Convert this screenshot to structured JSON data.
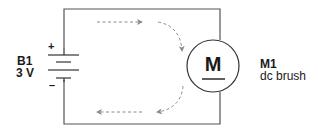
{
  "battery": {
    "name": "B1",
    "voltage": "3 V",
    "positive_symbol": "+",
    "negative_symbol": "–"
  },
  "motor": {
    "symbol": "M",
    "name": "M1",
    "type": "dc brush"
  },
  "current_flow": {
    "direction": "clockwise",
    "arrow_color": "#8a8a8a"
  },
  "colors": {
    "wire": "#555555",
    "text": "#1a1a1a",
    "background": "#ffffff"
  }
}
